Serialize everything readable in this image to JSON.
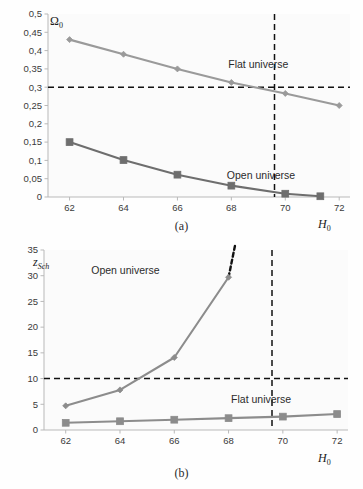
{
  "figure": {
    "panels": [
      {
        "id": "a",
        "caption": "(a)",
        "ylabel": "Ω",
        "ylabel_sub": "0",
        "xlabel": "H",
        "xlabel_sub": "0"
      },
      {
        "id": "b",
        "caption": "(b)",
        "ylabel": "z",
        "ylabel_sub": "Sch",
        "xlabel": "H",
        "xlabel_sub": "0"
      }
    ]
  },
  "chart_data": [
    {
      "type": "line",
      "panel": "a",
      "title": "",
      "xlabel": "H_0",
      "ylabel": "Omega_0",
      "x": [
        62,
        64,
        66,
        68,
        70,
        72
      ],
      "xlim": [
        61.2,
        72.4
      ],
      "ylim": [
        0,
        0.5
      ],
      "xticks": [
        62,
        64,
        66,
        68,
        70,
        72
      ],
      "xticklabels": [
        "62",
        "64",
        "66",
        "68",
        "70",
        "72"
      ],
      "yticks": [
        0,
        0.05,
        0.1,
        0.15,
        0.2,
        0.25,
        0.3,
        0.35,
        0.4,
        0.45,
        0.5
      ],
      "yticklabels": [
        "0",
        "0,05",
        "0,1",
        "0,15",
        "0,2",
        "0,25",
        "0,3",
        "0,35",
        "0,4",
        "0,45",
        "0,5"
      ],
      "grid": false,
      "legend_position": "inline-annotations",
      "series": [
        {
          "name": "Flat universe",
          "marker": "diamond",
          "color": "#9a9a9a",
          "x": [
            62,
            64,
            66,
            68,
            70,
            72
          ],
          "values": [
            0.43,
            0.39,
            0.35,
            0.313,
            0.283,
            0.25
          ]
        },
        {
          "name": "Open universe",
          "marker": "square",
          "color": "#6e6e6e",
          "x": [
            62,
            64,
            66,
            68,
            70,
            71.3
          ],
          "values": [
            0.15,
            0.101,
            0.061,
            0.031,
            0.009,
            0.002
          ]
        }
      ],
      "annotations": [
        {
          "text": "Flat universe",
          "x": 69.0,
          "y": 0.352
        },
        {
          "text": "Open universe",
          "x": 69.1,
          "y": 0.049
        }
      ],
      "reference_lines": [
        {
          "orientation": "horizontal",
          "value": 0.3,
          "style": "dashed",
          "color": "#111111"
        },
        {
          "orientation": "vertical",
          "value": 69.6,
          "style": "dashed",
          "color": "#111111"
        }
      ]
    },
    {
      "type": "line",
      "panel": "b",
      "title": "",
      "xlabel": "H_0",
      "ylabel": "z_Sch",
      "x": [
        62,
        64,
        66,
        68,
        70,
        72
      ],
      "xlim": [
        61.2,
        72.4
      ],
      "ylim": [
        0,
        35
      ],
      "xticks": [
        62,
        64,
        66,
        68,
        70,
        72
      ],
      "xticklabels": [
        "62",
        "64",
        "66",
        "68",
        "70",
        "72"
      ],
      "yticks": [
        0,
        5,
        10,
        15,
        20,
        25,
        30,
        35
      ],
      "yticklabels": [
        "0",
        "5",
        "10",
        "15",
        "20",
        "25",
        "30",
        "35"
      ],
      "grid": false,
      "legend_position": "inline-annotations",
      "series": [
        {
          "name": "Open universe",
          "marker": "diamond",
          "color": "#8c8c8c",
          "x": [
            62,
            64,
            66,
            68
          ],
          "values": [
            4.7,
            7.8,
            14.1,
            29.7
          ],
          "extension": {
            "style": "dashed",
            "color": "#111111",
            "from": [
              68,
              29.7
            ],
            "to": [
              68.25,
              36.2
            ]
          }
        },
        {
          "name": "Flat universe",
          "marker": "square",
          "color": "#8c8c8c",
          "x": [
            62,
            64,
            66,
            68,
            70,
            72
          ],
          "values": [
            1.4,
            1.7,
            2.0,
            2.3,
            2.6,
            3.1
          ]
        }
      ],
      "annotations": [
        {
          "text": "Open universe",
          "x": 64.2,
          "y": 30.4
        },
        {
          "text": "Flat universe",
          "x": 69.2,
          "y": 5.2
        }
      ],
      "reference_lines": [
        {
          "orientation": "horizontal",
          "value": 10,
          "style": "dashed",
          "color": "#111111"
        },
        {
          "orientation": "vertical",
          "value": 69.6,
          "style": "dashed",
          "color": "#111111"
        }
      ]
    }
  ]
}
